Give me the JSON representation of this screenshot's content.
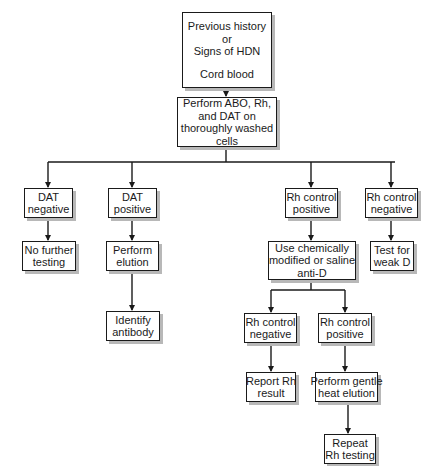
{
  "diagram": {
    "type": "flowchart",
    "nodes": {
      "start": {
        "lines": [
          "Previous history",
          "or",
          "Signs of HDN",
          "",
          "Cord blood"
        ]
      },
      "perform_abo": {
        "lines": [
          "Perform ABO, Rh,",
          "and DAT on",
          "thoroughly washed",
          "cells"
        ]
      },
      "dat_negative": {
        "lines": [
          "DAT",
          "negative"
        ]
      },
      "dat_positive": {
        "lines": [
          "DAT",
          "positive"
        ]
      },
      "rh_control_positive": {
        "lines": [
          "Rh control",
          "positive"
        ]
      },
      "rh_control_negative": {
        "lines": [
          "Rh control",
          "negative"
        ]
      },
      "no_further_testing": {
        "lines": [
          "No further",
          "testing"
        ]
      },
      "perform_elution": {
        "lines": [
          "Perform",
          "elution"
        ]
      },
      "use_chemically_modified": {
        "lines": [
          "Use chemically",
          "modified or saline",
          "anti-D"
        ]
      },
      "test_weak_d": {
        "lines": [
          "Test for",
          "weak D"
        ]
      },
      "identify_antibody": {
        "lines": [
          "Identify",
          "antibody"
        ]
      },
      "rh_control_negative_2": {
        "lines": [
          "Rh control",
          "negative"
        ]
      },
      "rh_control_positive_2": {
        "lines": [
          "Rh control",
          "positive"
        ]
      },
      "report_rh_result": {
        "lines": [
          "Report Rh",
          "result"
        ]
      },
      "perform_gentle_heat_elution": {
        "lines": [
          "Perform gentle",
          "heat elution"
        ]
      },
      "repeat_rh_testing": {
        "lines": [
          "Repeat",
          "Rh testing"
        ]
      }
    },
    "edges": [
      [
        "start",
        "perform_abo"
      ],
      [
        "perform_abo",
        "dat_negative"
      ],
      [
        "perform_abo",
        "dat_positive"
      ],
      [
        "perform_abo",
        "rh_control_positive"
      ],
      [
        "perform_abo",
        "rh_control_negative"
      ],
      [
        "dat_negative",
        "no_further_testing"
      ],
      [
        "dat_positive",
        "perform_elution"
      ],
      [
        "perform_elution",
        "identify_antibody"
      ],
      [
        "rh_control_positive",
        "use_chemically_modified"
      ],
      [
        "rh_control_negative",
        "test_weak_d"
      ],
      [
        "use_chemically_modified",
        "rh_control_negative_2"
      ],
      [
        "use_chemically_modified",
        "rh_control_positive_2"
      ],
      [
        "rh_control_negative_2",
        "report_rh_result"
      ],
      [
        "rh_control_positive_2",
        "perform_gentle_heat_elution"
      ],
      [
        "perform_gentle_heat_elution",
        "repeat_rh_testing"
      ]
    ]
  }
}
